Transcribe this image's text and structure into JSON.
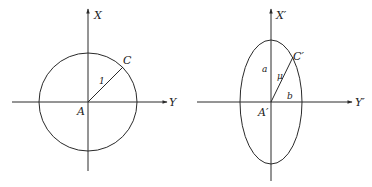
{
  "figures": [
    {
      "name": "circle-figure",
      "description": "Unit circle centered at A with radius AC = 1",
      "labels": {
        "vertical_axis": "X",
        "horizontal_axis": "Y",
        "center": "A",
        "point": "C",
        "radius": "1"
      }
    },
    {
      "name": "ellipse-figure",
      "description": "Ellipse centered at A' with semi-axes a (vertical) and b (horizontal), radius A'C' = μ",
      "labels": {
        "vertical_axis": "X′",
        "horizontal_axis": "Y′",
        "center": "A′",
        "point": "C′",
        "radius": "μ",
        "semi_major": "a",
        "semi_minor": "b"
      }
    }
  ],
  "colors": {
    "stroke": "#2a2a2a",
    "background": "#ffffff"
  }
}
